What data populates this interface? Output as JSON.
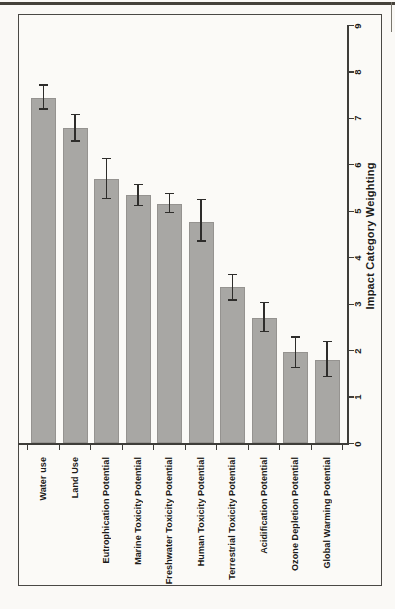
{
  "chart_data": {
    "type": "bar",
    "note": "landscape horizontal-bar chart rotated 90deg counter-clockwise; all text reads bottom-to-top",
    "categories": [
      "Water use",
      "Land Use",
      "Eutrophication Potential",
      "Marine Toxicity Potential",
      "Freshwater Toxicity Potential",
      "Human Toxicity Potential",
      "Terrestrial Toxicity Potential",
      "Acidification Potential",
      "Ozone Depletion Potential",
      "Global Warming Potential"
    ],
    "values": [
      7.45,
      6.8,
      5.7,
      5.35,
      5.15,
      4.77,
      3.37,
      2.71,
      1.97,
      1.8
    ],
    "errors_up": [
      0.27,
      0.29,
      0.44,
      0.23,
      0.23,
      0.48,
      0.27,
      0.32,
      0.32,
      0.4
    ],
    "errors_down": [
      0.25,
      0.29,
      0.42,
      0.22,
      0.18,
      0.41,
      0.28,
      0.3,
      0.34,
      0.36
    ],
    "xlabel": "",
    "ylabel": "Impact Category Weighting",
    "ylim": [
      0,
      9
    ],
    "yticks": [
      0,
      1,
      2,
      3,
      4,
      5,
      6,
      7,
      8,
      9
    ],
    "grid": "off",
    "legend": "none",
    "colors": {
      "bar": "#a8a7a4",
      "error_bar": "#2e2d2b",
      "axis": "#3e3d39",
      "frame": "#4a4945",
      "text": "#1b1a18",
      "background": "#faf9f6"
    }
  }
}
